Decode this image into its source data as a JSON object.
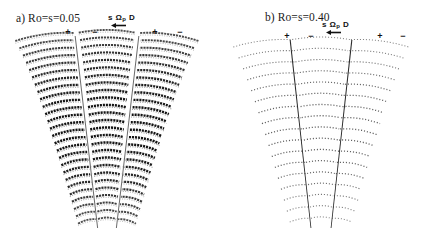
{
  "figure": {
    "background": "#ffffff",
    "ink": "#141414",
    "panels": [
      {
        "id": "a",
        "label": "a) Ro=s=0.05",
        "annotation_main": "s ",
        "annotation_symbol": "Ω",
        "annotation_sub": "p",
        "annotation_tail": " D",
        "markers": [
          "+",
          "−",
          "+",
          "−"
        ],
        "arrow_direction": "left",
        "density": "dense",
        "row_count": 26,
        "dash_length": 2.1,
        "dash_gap": 0.9,
        "stroke_width": 1.9,
        "opacity": 0.92,
        "sectors": 3,
        "divider_color": "#ffffff",
        "divider_width_top": 5.0,
        "divider_width_bottom": 1.2,
        "top_half_width": 95,
        "bottom_half_width": 28,
        "arc_sag_top": 11,
        "arc_sag_bottom": 6
      },
      {
        "id": "b",
        "label": "b) Ro=s=0.40",
        "annotation_main": "s ",
        "annotation_symbol": "Ω",
        "annotation_sub": "p",
        "annotation_tail": " D",
        "markers": [
          "+",
          "−",
          "+",
          "−"
        ],
        "arrow_direction": "left",
        "density": "sparse",
        "row_count": 17,
        "dash_length": 1.1,
        "dash_gap": 1.9,
        "stroke_width": 1.0,
        "opacity": 0.62,
        "sectors": 3,
        "divider_color": "#2a2a2a",
        "divider_width_top": 1.1,
        "divider_width_bottom": 0.8,
        "top_half_width": 92,
        "bottom_half_width": 30,
        "arc_sag_top": 10,
        "arc_sag_bottom": 5
      }
    ]
  },
  "chart_data": {
    "type": "line",
    "title": "",
    "xlabel": "",
    "ylabel": "",
    "subplots": [
      {
        "label": "a) Ro=s=0.05",
        "rossby_number": 0.05,
        "s_parameter": 0.05,
        "annotation": "s Ωp D",
        "polarity_markers": [
          "+",
          "−",
          "+",
          "−"
        ],
        "drift_arrow": "left",
        "radial_sector_count": 3,
        "azimuthal_row_count": 26,
        "field_character": "dense dark banded arcs, strong amplitude"
      },
      {
        "label": "b) Ro=s=0.40",
        "rossby_number": 0.4,
        "s_parameter": 0.4,
        "annotation": "s Ωp D",
        "polarity_markers": [
          "+",
          "−",
          "+",
          "−"
        ],
        "drift_arrow": "left",
        "radial_sector_count": 3,
        "azimuthal_row_count": 17,
        "field_character": "sparse faint dotted arcs, weak amplitude"
      }
    ],
    "legend": []
  }
}
